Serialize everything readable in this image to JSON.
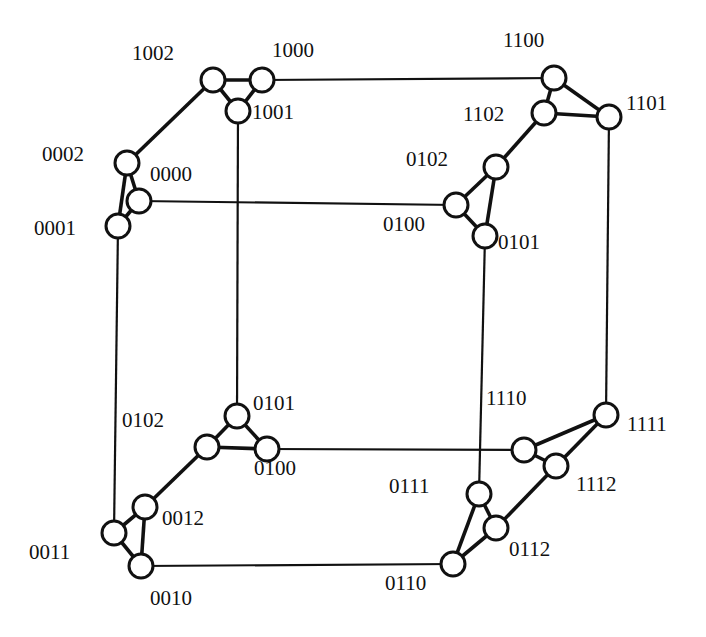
{
  "diagram": {
    "title": "",
    "node_radius": 12,
    "nodes": [
      {
        "id": "n1002",
        "label": "1002",
        "x": 213,
        "y": 80,
        "lx": 132,
        "ly": 60
      },
      {
        "id": "n1000",
        "label": "1000",
        "x": 262,
        "y": 80,
        "lx": 272,
        "ly": 57
      },
      {
        "id": "n1001",
        "label": "1001",
        "x": 238,
        "y": 111,
        "lx": 252,
        "ly": 119
      },
      {
        "id": "n0002",
        "label": "0002",
        "x": 127,
        "y": 163,
        "lx": 42,
        "ly": 161
      },
      {
        "id": "n0000",
        "label": "0000",
        "x": 139,
        "y": 201,
        "lx": 150,
        "ly": 181
      },
      {
        "id": "n0001",
        "label": "0001",
        "x": 118,
        "y": 226,
        "lx": 34,
        "ly": 235
      },
      {
        "id": "n1100",
        "label": "1100",
        "x": 554,
        "y": 78,
        "lx": 503,
        "ly": 47
      },
      {
        "id": "n1102",
        "label": "1102",
        "x": 544,
        "y": 113,
        "lx": 463,
        "ly": 121
      },
      {
        "id": "n1101",
        "label": "1101",
        "x": 609,
        "y": 117,
        "lx": 626,
        "ly": 110
      },
      {
        "id": "n0102",
        "label": "0102",
        "x": 496,
        "y": 167,
        "lx": 406,
        "ly": 166
      },
      {
        "id": "n0100",
        "label": "0100",
        "x": 456,
        "y": 205,
        "lx": 383,
        "ly": 231
      },
      {
        "id": "n0101",
        "label": "0101",
        "x": 485,
        "y": 236,
        "lx": 498,
        "ly": 249
      },
      {
        "id": "b0101",
        "label": "0101",
        "x": 237,
        "y": 416,
        "lx": 253,
        "ly": 410
      },
      {
        "id": "b0102",
        "label": "0102",
        "x": 207,
        "y": 447,
        "lx": 122,
        "ly": 427
      },
      {
        "id": "b0100",
        "label": "0100",
        "x": 267,
        "y": 449,
        "lx": 254,
        "ly": 475
      },
      {
        "id": "b0012",
        "label": "0012",
        "x": 145,
        "y": 507,
        "lx": 162,
        "ly": 525
      },
      {
        "id": "b0011",
        "label": "0011",
        "x": 114,
        "y": 533,
        "lx": 29,
        "ly": 559
      },
      {
        "id": "b0010",
        "label": "0010",
        "x": 141,
        "y": 566,
        "lx": 150,
        "ly": 605
      },
      {
        "id": "b1110",
        "label": "1110",
        "x": 524,
        "y": 450,
        "lx": 486,
        "ly": 405
      },
      {
        "id": "b1111",
        "label": "1111",
        "x": 606,
        "y": 415,
        "lx": 627,
        "ly": 431
      },
      {
        "id": "b1112",
        "label": "1112",
        "x": 556,
        "y": 466,
        "lx": 576,
        "ly": 491
      },
      {
        "id": "b0111",
        "label": "0111",
        "x": 479,
        "y": 494,
        "lx": 389,
        "ly": 493
      },
      {
        "id": "b0112",
        "label": "0112",
        "x": 496,
        "y": 528,
        "lx": 509,
        "ly": 556
      },
      {
        "id": "b0110",
        "label": "0110",
        "x": 453,
        "y": 564,
        "lx": 385,
        "ly": 590
      }
    ],
    "cycle_edges": [
      [
        "n1002",
        "n1000"
      ],
      [
        "n1000",
        "n1001"
      ],
      [
        "n1001",
        "n1002"
      ],
      [
        "n0002",
        "n0000"
      ],
      [
        "n0000",
        "n0001"
      ],
      [
        "n0001",
        "n0002"
      ],
      [
        "n1100",
        "n1102"
      ],
      [
        "n1102",
        "n1101"
      ],
      [
        "n1101",
        "n1100"
      ],
      [
        "n0102",
        "n0100"
      ],
      [
        "n0100",
        "n0101"
      ],
      [
        "n0101",
        "n0102"
      ],
      [
        "b0101",
        "b0102"
      ],
      [
        "b0102",
        "b0100"
      ],
      [
        "b0100",
        "b0101"
      ],
      [
        "b0012",
        "b0011"
      ],
      [
        "b0011",
        "b0010"
      ],
      [
        "b0010",
        "b0012"
      ],
      [
        "b1110",
        "b1111"
      ],
      [
        "b1111",
        "b1112"
      ],
      [
        "b1112",
        "b1110"
      ],
      [
        "b0111",
        "b0112"
      ],
      [
        "b0112",
        "b0110"
      ],
      [
        "b0110",
        "b0111"
      ]
    ],
    "cube_edges_thick": [
      [
        "n1002",
        "n0002"
      ],
      [
        "n1102",
        "n0102"
      ],
      [
        "b0102",
        "b0012"
      ],
      [
        "b1112",
        "b0112"
      ]
    ],
    "cube_edges_thin": [
      [
        "n1000",
        "n1100"
      ],
      [
        "n0000",
        "n0100"
      ],
      [
        "b0100",
        "b1110"
      ],
      [
        "b0010",
        "b0110"
      ],
      [
        "n1001",
        "b0101"
      ],
      [
        "n0001",
        "b0011"
      ],
      [
        "n1101",
        "b1111"
      ],
      [
        "n0101",
        "b0111"
      ]
    ]
  }
}
